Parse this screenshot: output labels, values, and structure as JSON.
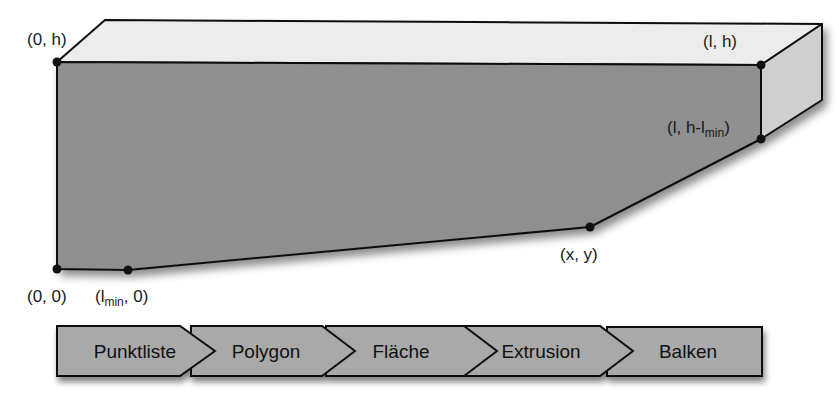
{
  "diagram": {
    "type": "beam-construction",
    "colors": {
      "front_face": "#8f8f8f",
      "top_face": "#ececec",
      "side_face": "#cfcfcf",
      "outline": "#111111",
      "step_fill": "#a9a9a9"
    },
    "points": [
      {
        "id": "p-0-h",
        "label": "(0, h)",
        "x": 57,
        "y": 62
      },
      {
        "id": "p-l-h",
        "label": "(l, h)",
        "x": 761,
        "y": 65
      },
      {
        "id": "p-l-h-lmin",
        "label_main": "(l, h-l",
        "label_sub": "min",
        "label_end": ")",
        "x": 761,
        "y": 139
      },
      {
        "id": "p-x-y",
        "label": "(x, y)",
        "x": 590,
        "y": 227
      },
      {
        "id": "p-lmin-0",
        "label_main": "(l",
        "label_sub": "min",
        "label_end": ", 0)",
        "x": 128,
        "y": 270
      },
      {
        "id": "p-0-0",
        "label": "(0, 0)",
        "x": 57,
        "y": 269
      }
    ]
  },
  "process": {
    "steps": [
      {
        "label": "Punktliste"
      },
      {
        "label": "Polygon"
      },
      {
        "label": "Fläche"
      },
      {
        "label": "Extrusion"
      },
      {
        "label": "Balken"
      }
    ]
  }
}
